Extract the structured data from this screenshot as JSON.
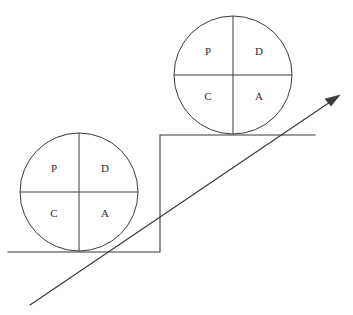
{
  "diagram": {
    "type": "pdca-cycle-on-ramp",
    "background_color": "#ffffff",
    "line_color": "#3a3a3a",
    "text_color": "#2b2b2b"
  },
  "wheels": [
    {
      "id": "upper-wheel",
      "name": "upper-pdca-wheel",
      "center_x": 233,
      "center_y": 75,
      "radius": 59,
      "quadrants": [
        {
          "key": "plan",
          "label": "P",
          "position": "top-left",
          "x": 208,
          "y": 52
        },
        {
          "key": "do",
          "label": "D",
          "position": "top-right",
          "x": 259,
          "y": 52
        },
        {
          "key": "check",
          "label": "C",
          "position": "bottom-left",
          "x": 208,
          "y": 97
        },
        {
          "key": "act",
          "label": "A",
          "position": "bottom-right",
          "x": 259,
          "y": 97
        }
      ]
    },
    {
      "id": "lower-wheel",
      "name": "lower-pdca-wheel",
      "center_x": 79,
      "center_y": 192,
      "radius": 59,
      "quadrants": [
        {
          "key": "plan",
          "label": "P",
          "position": "top-left",
          "x": 54,
          "y": 169
        },
        {
          "key": "do",
          "label": "D",
          "position": "top-right",
          "x": 105,
          "y": 169
        },
        {
          "key": "check",
          "label": "C",
          "position": "bottom-left",
          "x": 54,
          "y": 214
        },
        {
          "key": "act",
          "label": "A",
          "position": "bottom-right",
          "x": 105,
          "y": 214
        }
      ]
    }
  ],
  "step": {
    "name": "staircase-step",
    "path": "M 8 252 L 160 252 L 160 135 L 315 135"
  },
  "ramp": {
    "name": "improvement-ramp-arrow",
    "x1": 30,
    "y1": 305,
    "x2": 336,
    "y2": 98,
    "arrowhead_points": "340,95 325,99 331,106"
  }
}
